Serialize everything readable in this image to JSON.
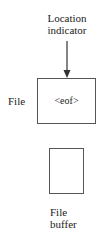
{
  "diagram": {
    "location_indicator": {
      "line1": "Location",
      "line2": "indicator"
    },
    "file": {
      "label": "File",
      "content": "<eof>"
    },
    "buffer": {
      "line1": "File",
      "line2": "buffer"
    },
    "colors": {
      "stroke": "#555555",
      "text": "#222222",
      "arrow": "#333333"
    }
  }
}
